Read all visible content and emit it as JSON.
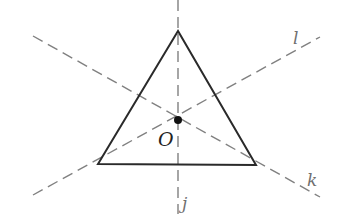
{
  "diagram": {
    "labels": {
      "center": "O",
      "line_vertical": "j",
      "line_rising": "l",
      "line_falling": "k"
    },
    "colors": {
      "triangle": "#2a2a2a",
      "dashed_lines": "#808080",
      "point": "#111111"
    }
  }
}
